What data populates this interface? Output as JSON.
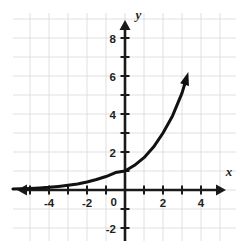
{
  "chart_data": {
    "type": "line",
    "title": "",
    "subtitle": "",
    "xlabel": "x",
    "ylabel": "y",
    "xlim": [
      -5.9,
      5.9
    ],
    "ylim": [
      -2.7,
      9.6
    ],
    "grid": true,
    "grid_step": 1,
    "legend": "none",
    "x_ticks": [
      -4,
      -2,
      0,
      2,
      4
    ],
    "x_tick_labels": [
      "-4",
      "-2",
      "0",
      "2",
      "4"
    ],
    "y_ticks": [
      -2,
      2,
      4,
      6,
      8
    ],
    "y_tick_labels": [
      "-2",
      "2",
      "4",
      "6",
      "8"
    ],
    "origin_label": "0",
    "series": [
      {
        "name": "exponential-curve",
        "color": "#111111",
        "has_arrow_end": true,
        "x": [
          -5.9,
          -5.5,
          -5.0,
          -4.5,
          -4.0,
          -3.5,
          -3.0,
          -2.5,
          -2.0,
          -1.5,
          -1.0,
          -0.5,
          0.0,
          0.5,
          1.0,
          1.5,
          2.0,
          2.5,
          3.0,
          3.15
        ],
        "y": [
          0.05,
          0.06,
          0.08,
          0.11,
          0.14,
          0.19,
          0.25,
          0.32,
          0.42,
          0.55,
          0.71,
          0.92,
          1.0,
          1.3,
          1.7,
          2.26,
          3.0,
          3.9,
          5.1,
          5.6
        ]
      }
    ],
    "annotations": [
      {
        "text": "x",
        "role": "x-axis-label",
        "x": 5.3,
        "y": 0.75
      },
      {
        "text": "y",
        "role": "y-axis-label",
        "x": 0.55,
        "y": 9.0
      }
    ],
    "colors": {
      "curve": "#111111",
      "axis": "#1a1a1a",
      "grid": "#d8d8d8",
      "text": "#231f20",
      "background": "#ffffff"
    }
  }
}
